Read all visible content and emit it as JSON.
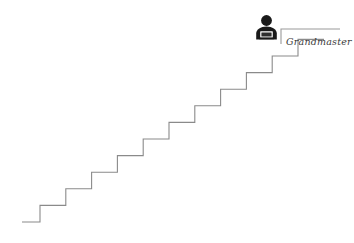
{
  "canvas": {
    "width": 354,
    "height": 243,
    "background": "#ffffff"
  },
  "illustration": {
    "title": "staircase-with-person-at-top",
    "line_color": "#8a8a8a",
    "line_width": 1.1,
    "figure_color": "#1a1a1a",
    "callout_color": "#9a9a9a"
  },
  "staircase": {
    "step_count": 11,
    "step_width": 25.8,
    "step_height": 16.6,
    "start_x": 22,
    "start_y": 222,
    "base_run": 18,
    "top_landing_run": 26
  },
  "person": {
    "icon_name": "person-with-laptop-icon",
    "x": 255,
    "y": 15,
    "width": 23,
    "height": 25,
    "color": "#1a1a1a"
  },
  "callout": {
    "label": "Grandmaster",
    "line_start_x": 281,
    "line_start_y": 44,
    "line_corner_x": 281,
    "line_corner_y": 29,
    "line_end_x": 340,
    "line_end_y": 29,
    "text_x": 286,
    "text_y": 45
  }
}
